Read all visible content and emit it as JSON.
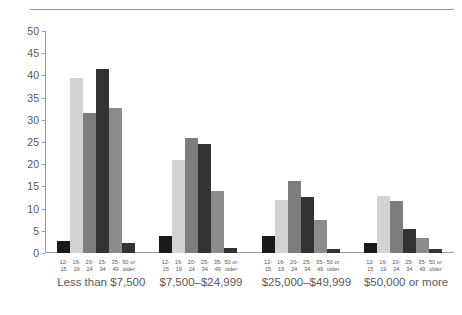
{
  "chart_data": {
    "type": "bar",
    "title": "",
    "subtitle": "",
    "xlabel": "",
    "ylabel": "",
    "ylim": [
      0,
      50
    ],
    "yticks": [
      0,
      5,
      10,
      15,
      20,
      25,
      30,
      35,
      40,
      45,
      50
    ],
    "grid": false,
    "legend_position": "none",
    "categories": [
      "Less than $7,500",
      "$7,500–$24,999",
      "$25,000–$49,999",
      "$50,000 or more"
    ],
    "age_groups": [
      "12–15",
      "16–19",
      "20–24",
      "25–34",
      "35–49",
      "50 or older"
    ],
    "series": [
      {
        "name": "12–15",
        "color": "#1a1a1a",
        "values": [
          2.8,
          3.8,
          3.8,
          2.3
        ]
      },
      {
        "name": "16–19",
        "color": "#d2d2d2",
        "values": [
          39.5,
          21.0,
          12.0,
          12.8
        ]
      },
      {
        "name": "20–24",
        "color": "#7d7d7d",
        "values": [
          31.5,
          26.0,
          16.2,
          11.8
        ]
      },
      {
        "name": "25–34",
        "color": "#333333",
        "values": [
          41.5,
          24.5,
          12.7,
          5.5
        ]
      },
      {
        "name": "35–49",
        "color": "#8c8c8c",
        "values": [
          32.7,
          14.0,
          7.5,
          3.4
        ]
      },
      {
        "name": "50 or older",
        "color": "#333333",
        "values": [
          2.3,
          1.2,
          1.0,
          1.0
        ]
      }
    ],
    "axis_color": "#9a9a9c",
    "text_color": "#58585a",
    "background": "#ffffff"
  }
}
